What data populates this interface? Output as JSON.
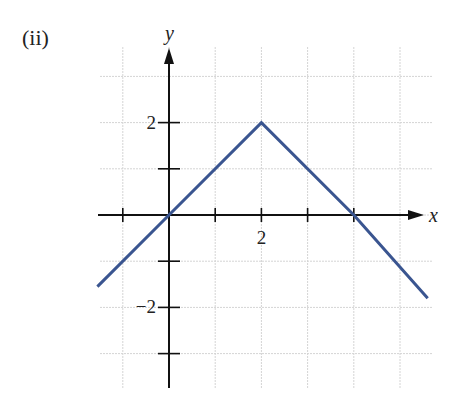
{
  "panel_label": "(ii)",
  "chart_data": {
    "type": "line",
    "title": "",
    "xlabel": "x",
    "ylabel": "y",
    "x_tick_labels": [
      {
        "value": 2,
        "label": "2"
      }
    ],
    "y_tick_labels": [
      {
        "value": 2,
        "label": "2"
      },
      {
        "value": -2,
        "label": "−2"
      }
    ],
    "xlim": [
      -1.5,
      5.7
    ],
    "ylim": [
      -3.7,
      3.7
    ],
    "grid": true,
    "legend": null,
    "series": [
      {
        "name": "piecewise linear",
        "color": "#3a5590",
        "x": [
          -1.55,
          0,
          2,
          4,
          5.6
        ],
        "y": [
          -1.55,
          0,
          2,
          0,
          -1.8
        ]
      }
    ],
    "annotations": []
  }
}
